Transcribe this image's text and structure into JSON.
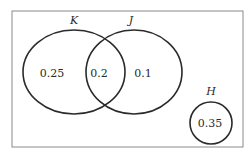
{
  "diagram": {
    "type": "venn",
    "sets": [
      {
        "name": "K",
        "label": "K"
      },
      {
        "name": "J",
        "label": "J"
      },
      {
        "name": "H",
        "label": "H"
      }
    ],
    "regions": {
      "k_only": "0.25",
      "k_and_j": "0.2",
      "j_only": "0.1",
      "h_only": "0.35"
    }
  }
}
